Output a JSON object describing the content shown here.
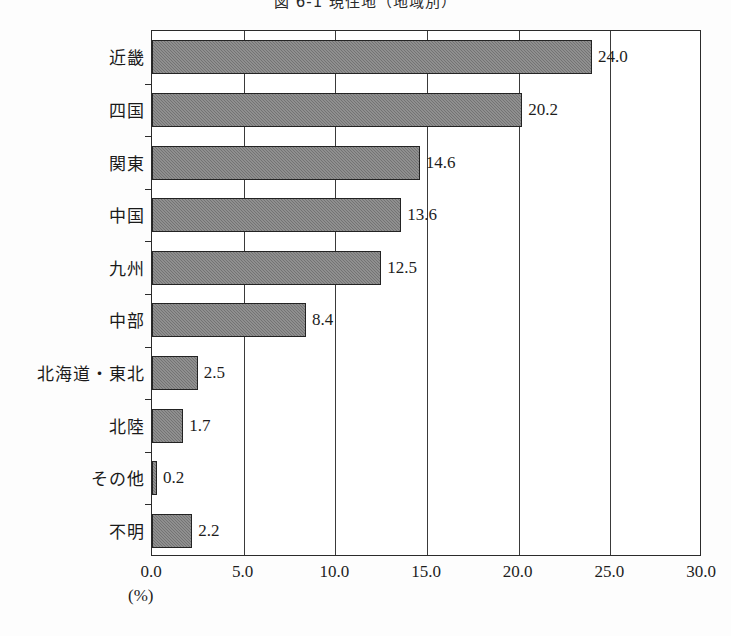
{
  "title": "図 6-1  現住地（地域別）",
  "unit_label": "(%)",
  "chart_data": {
    "type": "bar",
    "orientation": "horizontal",
    "title": "図 6-1  現住地（地域別）",
    "xlabel": "(%)",
    "ylabel": "",
    "xlim": [
      0.0,
      30.0
    ],
    "xticks": [
      "0.0",
      "5.0",
      "10.0",
      "15.0",
      "20.0",
      "25.0",
      "30.0"
    ],
    "xtick_values": [
      0,
      5,
      10,
      15,
      20,
      25,
      30
    ],
    "grid": true,
    "legend": "none",
    "categories": [
      "近畿",
      "四国",
      "関東",
      "中国",
      "九州",
      "中部",
      "北海道・東北",
      "北陸",
      "その他",
      "不明"
    ],
    "values": [
      24.0,
      20.2,
      14.6,
      13.6,
      12.5,
      8.4,
      2.5,
      1.7,
      0.2,
      2.2
    ],
    "value_labels": [
      "24.0",
      "20.2",
      "14.6",
      "13.6",
      "12.5",
      "8.4",
      "2.5",
      "1.7",
      "0.2",
      "2.2"
    ],
    "bar_color": "#808080",
    "bar_edge_color": "#232323"
  }
}
